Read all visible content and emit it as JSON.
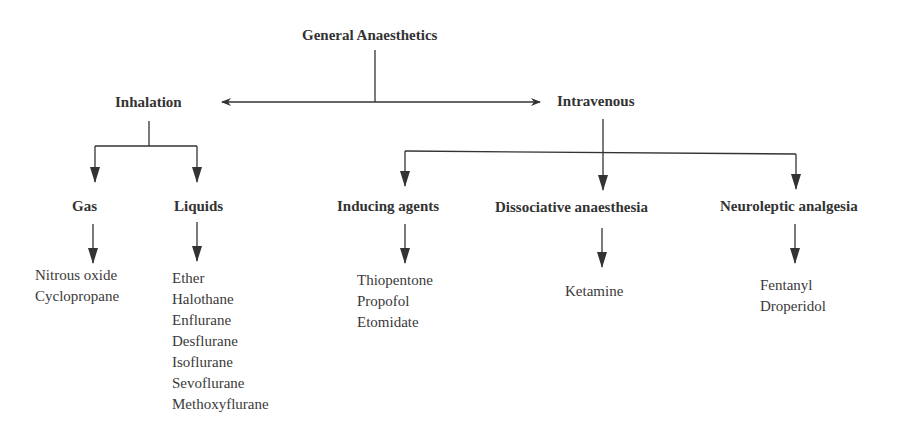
{
  "diagram": {
    "root": {
      "label": "General Anaesthetics"
    },
    "categories": [
      {
        "label": "Inhalation",
        "children": [
          {
            "label": "Gas",
            "items": [
              "Nitrous oxide",
              "Cyclopropane"
            ]
          },
          {
            "label": "Liquids",
            "items": [
              "Ether",
              "Halothane",
              "Enflurane",
              "Desflurane",
              "Isoflurane",
              "Sevoflurane",
              "Methoxyflurane"
            ]
          }
        ]
      },
      {
        "label": "Intravenous",
        "children": [
          {
            "label": "Inducing agents",
            "items": [
              "Thiopentone",
              "Propofol",
              "Etomidate"
            ]
          },
          {
            "label": "Dissociative anaesthesia",
            "items": [
              "Ketamine"
            ]
          },
          {
            "label": "Neuroleptic analgesia",
            "items": [
              "Fentanyl",
              "Droperidol"
            ]
          }
        ]
      }
    ],
    "line_color": "#333333"
  }
}
